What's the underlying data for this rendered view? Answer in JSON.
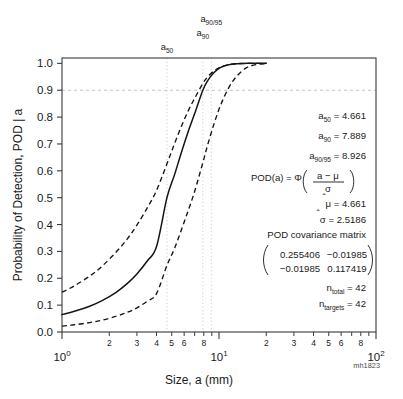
{
  "watermark": "mh1823",
  "axes": {
    "ylabel": "Probability of Detection, POD | a",
    "xlabel": "Size, a  (mm)",
    "y_ticks": [
      "0.0",
      "0.1",
      "0.2",
      "0.3",
      "0.4",
      "0.5",
      "0.6",
      "0.7",
      "0.8",
      "0.9",
      "1.0"
    ],
    "x_decade_labels": [
      "10",
      "10",
      "10"
    ],
    "x_decade_exponents": [
      "0",
      "1",
      "2"
    ],
    "x_minor_labels": [
      "2",
      "3",
      "4",
      "5",
      "6",
      "8"
    ]
  },
  "vlines": [
    {
      "name": "a50",
      "base": "a",
      "sub": "50",
      "value": 4.661
    },
    {
      "name": "a90",
      "base": "a",
      "sub": "90",
      "value": 7.889
    },
    {
      "name": "a90_95",
      "base": "a",
      "sub": "90/95",
      "value": 8.926
    }
  ],
  "hline": {
    "label": "0.9",
    "value": 0.9
  },
  "annotations": {
    "a50": {
      "base": "a",
      "sub": "50",
      "eq": "= 4.661"
    },
    "a90": {
      "base": "a",
      "sub": "90",
      "eq": "= 7.889"
    },
    "a90_95": {
      "base": "a",
      "sub": "90/95",
      "eq": "= 8.926"
    },
    "formula_lhs": "POD(a) = ",
    "formula_phi": "Φ",
    "formula_num": "a − μ",
    "formula_den": "σ",
    "mu_hat_symbol": "μ",
    "mu_hat_eq": "= 4.661",
    "sigma_hat_symbol": "σ",
    "sigma_hat_eq": "= 2.5186",
    "cov_title": "POD covariance matrix",
    "cov_matrix": [
      [
        "0.255406",
        "−0.01985"
      ],
      [
        "−0.01985",
        "0.117419"
      ]
    ],
    "n_total_base": "n",
    "n_total_sub": "total",
    "n_total_eq": "= 42",
    "n_targets_base": "n",
    "n_targets_sub": "targets",
    "n_targets_eq": "= 42"
  },
  "chart_data": {
    "type": "line",
    "title": "",
    "xlabel": "Size, a  (mm)",
    "ylabel": "Probability of Detection, POD | a",
    "xscale": "log",
    "xlim": [
      1,
      100
    ],
    "ylim": [
      0,
      1.02
    ],
    "grid": "reference-lines-only",
    "legend": "none",
    "model": "POD(a) = Phi((a - mu)/sigma)",
    "mu_hat": 4.661,
    "sigma_hat": 2.5186,
    "a50": 4.661,
    "a90": 7.889,
    "a90_95": 8.926,
    "n_total": 42,
    "n_targets": 42,
    "covariance": [
      [
        0.255406,
        -0.01985
      ],
      [
        -0.01985,
        0.117419
      ]
    ],
    "series": [
      {
        "name": "POD estimate",
        "style": "solid",
        "x": [
          1.0,
          1.2,
          1.5,
          1.8,
          2.2,
          2.6,
          3.0,
          3.5,
          4.0,
          4.661,
          5.2,
          5.8,
          6.4,
          7.0,
          7.889,
          8.5,
          9.3,
          10.2,
          11.5,
          13.0,
          15.0,
          17.5,
          20.0
        ],
        "y": [
          0.065,
          0.077,
          0.096,
          0.117,
          0.147,
          0.18,
          0.216,
          0.265,
          0.318,
          0.5,
          0.584,
          0.674,
          0.75,
          0.813,
          0.9,
          0.937,
          0.966,
          0.984,
          0.995,
          0.999,
          1.0,
          1.0,
          1.0
        ]
      },
      {
        "name": "Upper 95% confidence bound",
        "style": "dashed",
        "x": [
          1.0,
          1.2,
          1.5,
          1.8,
          2.2,
          2.6,
          3.0,
          3.5,
          4.0,
          4.661,
          5.2,
          5.8,
          6.4,
          7.0,
          7.889,
          8.5,
          9.3,
          10.2,
          11.5,
          13.0,
          15.0,
          17.5,
          20.0
        ],
        "y": [
          0.148,
          0.172,
          0.208,
          0.245,
          0.296,
          0.346,
          0.398,
          0.463,
          0.527,
          0.626,
          0.7,
          0.77,
          0.826,
          0.87,
          0.925,
          0.951,
          0.972,
          0.986,
          0.995,
          0.999,
          1.0,
          1.0,
          1.0
        ]
      },
      {
        "name": "Lower 95% confidence bound",
        "style": "dashed",
        "x": [
          1.0,
          1.2,
          1.5,
          1.8,
          2.2,
          2.6,
          3.0,
          3.5,
          4.0,
          4.661,
          5.2,
          5.8,
          6.4,
          7.0,
          7.889,
          8.5,
          9.3,
          10.2,
          11.5,
          13.0,
          15.0,
          17.5,
          20.0
        ],
        "y": [
          0.022,
          0.027,
          0.035,
          0.044,
          0.058,
          0.073,
          0.09,
          0.115,
          0.143,
          0.248,
          0.31,
          0.385,
          0.456,
          0.524,
          0.63,
          0.7,
          0.775,
          0.842,
          0.908,
          0.953,
          0.984,
          0.996,
          0.999
        ]
      }
    ]
  }
}
